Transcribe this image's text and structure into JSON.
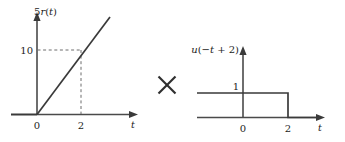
{
  "figure": {
    "operator": "×",
    "operator_name": "multiplication-sign"
  },
  "left_plot": {
    "function_label": "5r(t)",
    "function_label_parts": {
      "coefficient": "5",
      "name": "r",
      "open": "(",
      "variable": "t",
      "close": ")"
    },
    "x_axis_label": "t",
    "y_value_label": "10",
    "x_ticks": [
      "0",
      "2"
    ],
    "guide_value": "10",
    "guide_time": "2"
  },
  "right_plot": {
    "function_label": "u(−t + 2)",
    "function_label_parts": {
      "name": "u",
      "open": "(",
      "sign": "−",
      "variable": "t",
      "operator": "+",
      "shift": "2",
      "close": ")"
    },
    "x_axis_label": "t",
    "y_value_label": "1",
    "x_ticks": [
      "0",
      "2"
    ],
    "step_height": "1",
    "step_edge_time": "2"
  },
  "chart_data": {
    "type": "line",
    "title": "",
    "charts": [
      {
        "id": "scaled-ramp",
        "type": "line",
        "title": "5r(t)",
        "xlabel": "t",
        "ylabel": "5r(t)",
        "xlim": [
          -0.45,
          3.3
        ],
        "ylim": [
          -1.2,
          14.5
        ],
        "series": [
          {
            "name": "5r(t)",
            "x": [
              0,
              2,
              3.0
            ],
            "y": [
              0,
              10,
              15
            ]
          },
          {
            "name": "zero-for-negative-t",
            "x": [
              -0.45,
              0
            ],
            "y": [
              0,
              0
            ]
          }
        ],
        "annotations": [
          {
            "type": "dashed-horizontal",
            "y": 10,
            "from_x": 0,
            "to_x": 2,
            "label": "10"
          },
          {
            "type": "dashed-vertical",
            "x": 2,
            "from_y": 0,
            "to_y": 10,
            "label": "2"
          }
        ],
        "xticks": [
          0,
          2
        ],
        "xticklabels": [
          "0",
          "2"
        ],
        "yticks": [
          10
        ],
        "yticklabels": [
          "10"
        ],
        "grid": false,
        "legend": "none"
      },
      {
        "id": "reversed-unit-step",
        "type": "line",
        "title": "u(−t + 2)",
        "xlabel": "t",
        "ylabel": "u(−t + 2)",
        "xlim": [
          -3.2,
          2.9
        ],
        "ylim": [
          -0.55,
          2.4
        ],
        "series": [
          {
            "name": "u(-t+2)",
            "x": [
              -3.2,
              2,
              2,
              2.9
            ],
            "y": [
              1,
              1,
              0,
              0
            ]
          }
        ],
        "annotations": [
          {
            "type": "level",
            "y": 1,
            "label": "1"
          }
        ],
        "xticks": [
          0,
          2
        ],
        "xticklabels": [
          "0",
          "2"
        ],
        "yticks": [
          1
        ],
        "yticklabels": [
          "1"
        ],
        "grid": false,
        "legend": "none"
      }
    ]
  }
}
